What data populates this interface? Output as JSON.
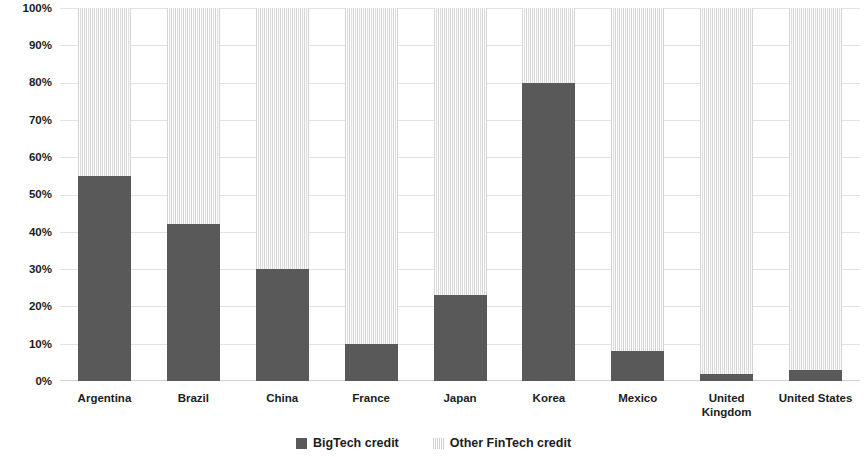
{
  "chart_data": {
    "type": "bar",
    "stacked": true,
    "stack_mode": "100-percent",
    "title": "",
    "subtitle": "",
    "xlabel": "",
    "ylabel": "",
    "ylim": [
      0,
      100
    ],
    "ytick_labels": [
      "100%",
      "90%",
      "80%",
      "70%",
      "60%",
      "50%",
      "40%",
      "30%",
      "20%",
      "10%",
      "0%"
    ],
    "ytick_values": [
      100,
      90,
      80,
      70,
      60,
      50,
      40,
      30,
      20,
      10,
      0
    ],
    "grid": true,
    "legend_position": "bottom",
    "categories": [
      "Argentina",
      "Brazil",
      "China",
      "France",
      "Japan",
      "Korea",
      "Mexico",
      "United\nKingdom",
      "United States"
    ],
    "series": [
      {
        "name": "BigTech credit",
        "color": "#595959",
        "pattern": "solid",
        "values": [
          55,
          42,
          30,
          10,
          23,
          80,
          8,
          2,
          3
        ]
      },
      {
        "name": "Other FinTech credit",
        "color": "#d9d9d9",
        "pattern": "vertical-lines",
        "values": [
          45,
          58,
          70,
          90,
          77,
          20,
          92,
          98,
          97
        ]
      }
    ]
  },
  "legend": {
    "items": [
      {
        "label": "BigTech credit",
        "swatch": "solid-dark-square"
      },
      {
        "label": "Other FinTech credit",
        "swatch": "patterned-light-square"
      }
    ]
  }
}
